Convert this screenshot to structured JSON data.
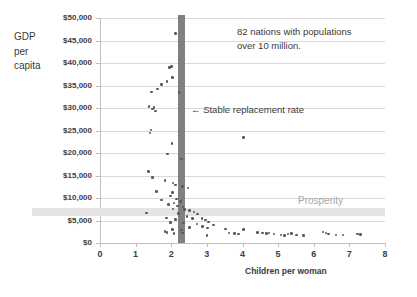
{
  "chart_data": {
    "type": "scatter",
    "title": "",
    "xlabel": "Children per woman",
    "ylabel": "GDP per capita",
    "ylabel_lines": [
      "GDP",
      "per",
      "capita"
    ],
    "xlim": [
      0,
      8
    ],
    "ylim": [
      0,
      50000
    ],
    "xticks": [
      0,
      1,
      2,
      3,
      4,
      5,
      6,
      7,
      8
    ],
    "xtick_labels": [
      "0",
      "1",
      "2",
      "3",
      "4",
      "5",
      "6",
      "7",
      "8"
    ],
    "yticks": [
      0,
      5000,
      10000,
      15000,
      20000,
      25000,
      30000,
      35000,
      40000,
      45000,
      50000
    ],
    "ytick_labels": [
      "$0",
      "$5,000",
      "$10,000",
      "$15,000",
      "$20,000",
      "$25,000",
      "$30,000",
      "$35,000",
      "$40,000",
      "$45,000",
      "$50,000"
    ],
    "grid": true,
    "legend": "none",
    "point_color": "#595959",
    "annotations": [
      {
        "name": "population-note",
        "text_lines": [
          "82 nations with populations",
          "over 10 million."
        ],
        "color": "#3b3b3b"
      },
      {
        "name": "stable-replacement-rate",
        "text": "← Stable replacement rate",
        "x_value": 2.3,
        "color": "#3b3b3b"
      },
      {
        "name": "prosperity-threshold",
        "text": "Prosperity",
        "y_value": 7000,
        "color": "#a6a6a6"
      }
    ],
    "markers": {
      "vertical_band": {
        "name": "stable-replacement-rate-bar",
        "x_value": 2.3,
        "color": "#808080",
        "y_from": 0,
        "y_to": 50000
      },
      "horizontal_band": {
        "name": "prosperity-band",
        "y_value": 7000,
        "color": "#e3e3e3",
        "x_from": 0,
        "x_to": 8
      }
    },
    "points": [
      [
        2.12,
        46500
      ],
      [
        1.95,
        39000
      ],
      [
        2.01,
        39200
      ],
      [
        2.04,
        36800
      ],
      [
        1.88,
        35900
      ],
      [
        1.72,
        35200
      ],
      [
        1.62,
        34200
      ],
      [
        2.22,
        33500
      ],
      [
        1.44,
        33600
      ],
      [
        1.38,
        30300
      ],
      [
        1.52,
        30100
      ],
      [
        1.55,
        29300
      ],
      [
        1.48,
        29800
      ],
      [
        1.43,
        25100
      ],
      [
        1.4,
        24400
      ],
      [
        2.02,
        22100
      ],
      [
        4.02,
        23400
      ],
      [
        1.9,
        19800
      ],
      [
        2.28,
        18700
      ],
      [
        1.36,
        15900
      ],
      [
        1.48,
        14600
      ],
      [
        1.82,
        13900
      ],
      [
        2.05,
        13300
      ],
      [
        2.12,
        12900
      ],
      [
        2.31,
        12500
      ],
      [
        2.47,
        12200
      ],
      [
        1.58,
        11400
      ],
      [
        2.04,
        11200
      ],
      [
        1.98,
        10400
      ],
      [
        2.15,
        9800
      ],
      [
        1.72,
        9600
      ],
      [
        2.26,
        9200
      ],
      [
        2.08,
        8900
      ],
      [
        1.92,
        8600
      ],
      [
        2.18,
        8200
      ],
      [
        2.33,
        8000
      ],
      [
        2.05,
        7600
      ],
      [
        2.38,
        7400
      ],
      [
        2.52,
        7200
      ],
      [
        1.3,
        6700
      ],
      [
        2.2,
        6500
      ],
      [
        2.64,
        6900
      ],
      [
        2.74,
        6400
      ],
      [
        2.44,
        5900
      ],
      [
        1.86,
        5600
      ],
      [
        2.6,
        5500
      ],
      [
        2.12,
        5200
      ],
      [
        2.86,
        5400
      ],
      [
        2.96,
        5100
      ],
      [
        1.98,
        4600
      ],
      [
        2.35,
        4400
      ],
      [
        3.05,
        4700
      ],
      [
        2.72,
        4200
      ],
      [
        3.18,
        4000
      ],
      [
        2.88,
        3700
      ],
      [
        2.52,
        3400
      ],
      [
        3.02,
        3300
      ],
      [
        2.04,
        3000
      ],
      [
        2.28,
        2900
      ],
      [
        1.82,
        2500
      ],
      [
        1.88,
        2300
      ],
      [
        2.08,
        2100
      ],
      [
        2.32,
        2200
      ],
      [
        3.0,
        1700
      ],
      [
        3.52,
        3100
      ],
      [
        3.62,
        2200
      ],
      [
        3.78,
        2100
      ],
      [
        3.88,
        2000
      ],
      [
        4.02,
        3000
      ],
      [
        4.42,
        2300
      ],
      [
        4.56,
        2200
      ],
      [
        4.68,
        2100
      ],
      [
        4.74,
        2200
      ],
      [
        4.88,
        2000
      ],
      [
        5.08,
        1800
      ],
      [
        5.18,
        1700
      ],
      [
        5.28,
        2000
      ],
      [
        5.38,
        2100
      ],
      [
        5.52,
        1800
      ],
      [
        5.72,
        1700
      ],
      [
        6.26,
        2400
      ],
      [
        6.34,
        2200
      ],
      [
        6.42,
        2000
      ],
      [
        6.62,
        1800
      ],
      [
        6.82,
        1800
      ],
      [
        7.22,
        2000
      ],
      [
        7.32,
        1900
      ]
    ]
  }
}
